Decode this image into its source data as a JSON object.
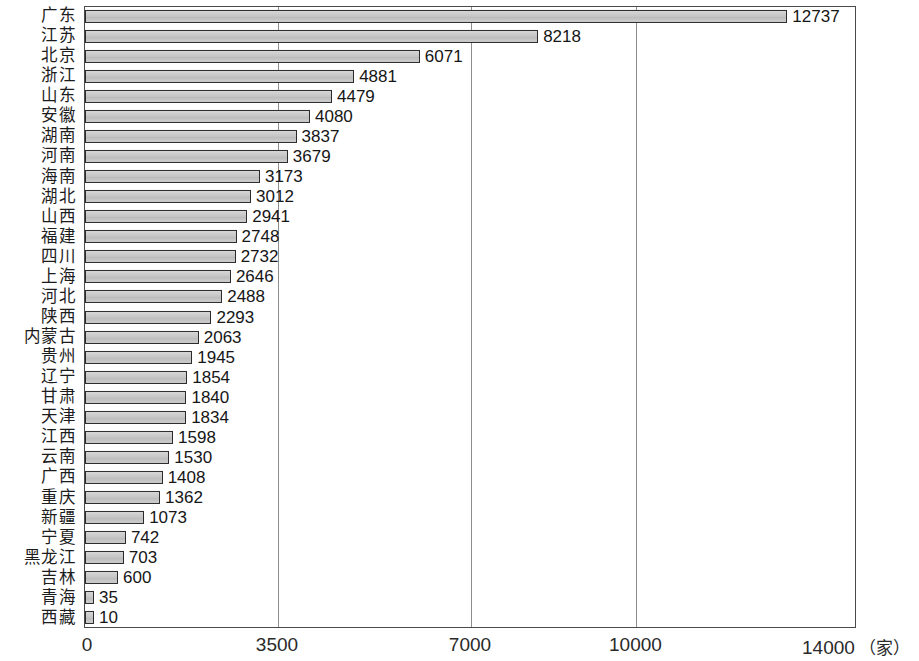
{
  "chart_data": {
    "type": "bar",
    "orientation": "horizontal",
    "title": "",
    "xlabel": "（家）",
    "ylabel": "",
    "xlim": [
      0,
      14000
    ],
    "grid": true,
    "grid_axis": "x",
    "legend": "none",
    "unit": "（家）",
    "xticks": [
      0,
      3500,
      7000,
      10000,
      14000
    ],
    "xtick_labels": [
      "0",
      "3500",
      "7000",
      "10000",
      "14000"
    ],
    "categories": [
      "广东",
      "江苏",
      "北京",
      "浙江",
      "山东",
      "安徽",
      "湖南",
      "河南",
      "海南",
      "湖北",
      "山西",
      "福建",
      "四川",
      "上海",
      "河北",
      "陕西",
      "内蒙古",
      "贵州",
      "辽宁",
      "甘肃",
      "天津",
      "江西",
      "云南",
      "广西",
      "重庆",
      "新疆",
      "宁夏",
      "黑龙江",
      "吉林",
      "青海",
      "西藏"
    ],
    "values": [
      12737,
      8218,
      6071,
      4881,
      4479,
      4080,
      3837,
      3679,
      3173,
      3012,
      2941,
      2748,
      2732,
      2646,
      2488,
      2293,
      2063,
      1945,
      1854,
      1840,
      1834,
      1598,
      1530,
      1408,
      1362,
      1073,
      742,
      703,
      600,
      35,
      10
    ],
    "value_labels": [
      "12737",
      "8218",
      "6071",
      "4881",
      "4479",
      "4080",
      "3837",
      "3679",
      "3173",
      "3012",
      "2941",
      "2748",
      "2732",
      "2646",
      "2488",
      "2293",
      "2063",
      "1945",
      "1854",
      "1840",
      "1834",
      "1598",
      "1530",
      "1408",
      "1362",
      "1073",
      "742",
      "703",
      "600",
      "35",
      "10"
    ],
    "bar_fill_color": "#c9c9c9",
    "bar_border_color": "#2b2b2b",
    "gridline_color": "#8d8d8d",
    "frame_color": "#4a4a4a"
  }
}
